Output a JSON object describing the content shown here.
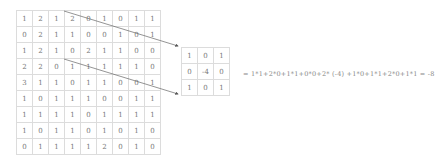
{
  "input_matrix": [
    [
      "1",
      "2",
      "1",
      "2",
      "0",
      "1",
      "0",
      "1",
      "1"
    ],
    [
      "0",
      "2",
      "1",
      "1",
      "0",
      "0",
      "1",
      "0",
      "1"
    ],
    [
      "1",
      "2",
      "1",
      "0",
      "2",
      "1",
      "1",
      "0",
      "0"
    ],
    [
      "2",
      "2",
      "0",
      "1",
      "1",
      "1",
      "1",
      "1",
      "0"
    ],
    [
      "3",
      "1",
      "1",
      "0",
      "1",
      "1",
      "0",
      "0",
      "1"
    ],
    [
      "1",
      "0",
      "1",
      "1",
      "1",
      "0",
      "0",
      "1",
      "1"
    ],
    [
      "1",
      "1",
      "1",
      "1",
      "0",
      "1",
      "1",
      "1",
      "1"
    ],
    [
      "1",
      "0",
      "1",
      "1",
      "0",
      "1",
      "0",
      "1",
      "0"
    ],
    [
      "0",
      "1",
      "1",
      "1",
      "1",
      "2",
      "0",
      "1",
      "0"
    ]
  ],
  "kernel_matrix": [
    [
      "1",
      "0",
      "1"
    ],
    [
      "0",
      "-4",
      "0"
    ],
    [
      "1",
      "0",
      "1"
    ]
  ],
  "equation": "= 1*1+2*0+1*1+0*0+2* (-4) +1*0+1*1+2*0+1*1 = -8",
  "colors": {
    "grid_line": "#dcdcdc",
    "text": "#777777",
    "arrow": "#555555"
  }
}
